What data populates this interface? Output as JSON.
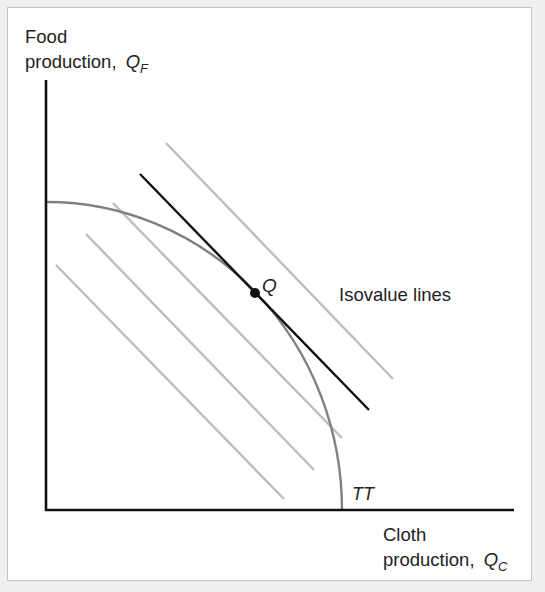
{
  "figure": {
    "y_axis_label": {
      "line1": "Food",
      "line2": "production,",
      "var": "Q",
      "sub": "F"
    },
    "x_axis_label": {
      "line1": "Cloth",
      "line2": "production,",
      "var": "Q",
      "sub": "C"
    },
    "point_label": "Q",
    "curve_label": "TT",
    "isovalue_label": "Isovalue lines",
    "colors": {
      "axis": "#111111",
      "curve": "#808080",
      "isovalue": "#bdbdbd",
      "tangent": "#111111",
      "point": "#111111"
    }
  },
  "chart_data": {
    "type": "diagram",
    "title": "",
    "xlabel": "Cloth production, Q_C",
    "ylabel": "Food production, Q_F",
    "curve": {
      "name": "TT",
      "shape": "concave production possibility frontier (quarter ellipse)",
      "origin_px": [
        47,
        510
      ],
      "radius_x_px": 295,
      "radius_y_px": 308
    },
    "tangency_point": {
      "label": "Q",
      "px": [
        255,
        293
      ]
    },
    "tangent_line": {
      "from_px": [
        140,
        174
      ],
      "to_px": [
        369,
        410
      ]
    },
    "isovalue_lines": [
      {
        "from_px": [
          56,
          265
        ],
        "to_px": [
          284,
          499
        ]
      },
      {
        "from_px": [
          86,
          234
        ],
        "to_px": [
          314,
          470
        ]
      },
      {
        "from_px": [
          113,
          203
        ],
        "to_px": [
          342,
          438
        ]
      },
      {
        "from_px": [
          166,
          143
        ],
        "to_px": [
          393,
          379
        ]
      }
    ],
    "annotations": [
      "Q",
      "TT",
      "Isovalue lines"
    ],
    "grid": false,
    "legend": null
  }
}
